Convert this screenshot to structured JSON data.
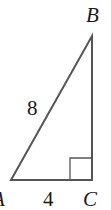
{
  "diagram": {
    "type": "right-triangle",
    "vertices": {
      "A": {
        "label": "A",
        "x": 11,
        "y": 180
      },
      "B": {
        "label": "B",
        "x": 92,
        "y": 36
      },
      "C": {
        "label": "C",
        "x": 92,
        "y": 180
      }
    },
    "right_angle_at": "C",
    "sides": {
      "AB": {
        "label": "8"
      },
      "AC": {
        "label": "4"
      }
    },
    "line_color": "#555555"
  }
}
